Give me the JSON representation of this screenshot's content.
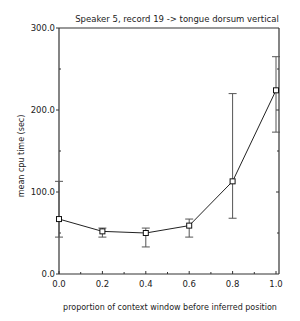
{
  "chart_data": {
    "type": "line",
    "title": "Speaker 5, record 19 -> tongue dorsum vertical",
    "xlabel": "proportion of context window before inferred position",
    "ylabel": "mean cpu time (sec)",
    "xlim": [
      0.0,
      1.0
    ],
    "ylim": [
      0.0,
      300.0
    ],
    "x_ticks": [
      "0.0",
      "0.2",
      "0.4",
      "0.6",
      "0.8",
      "1.0"
    ],
    "y_ticks": [
      "0.0",
      "100.0",
      "200.0",
      "300.0"
    ],
    "grid": false,
    "legend": null,
    "x": [
      0.0,
      0.2,
      0.4,
      0.6,
      0.8,
      1.0
    ],
    "series": [
      {
        "name": "mean cpu time",
        "values": [
          67,
          52,
          50,
          59,
          113,
          224
        ],
        "error_low": [
          45,
          45,
          33,
          45,
          68,
          173
        ],
        "error_high": [
          113,
          56,
          56,
          67,
          220,
          265
        ]
      }
    ]
  }
}
